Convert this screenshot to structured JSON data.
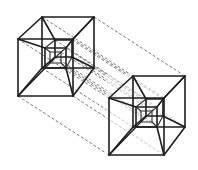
{
  "diagram": {
    "type": "line-drawing",
    "colors": {
      "ink": "#1e1e1e",
      "dash": "#555555",
      "background": "#ffffff"
    },
    "figures": [
      {
        "name": "left-tesseract",
        "outer_back": [
          [
            42,
            17
          ],
          [
            94,
            17
          ],
          [
            94,
            68
          ],
          [
            42,
            68
          ]
        ],
        "outer_front": [
          [
            18,
            39
          ],
          [
            73,
            39
          ],
          [
            73,
            96
          ],
          [
            18,
            96
          ]
        ],
        "inner_mid": [
          [
            45,
            48
          ],
          [
            66,
            48
          ],
          [
            66,
            68
          ],
          [
            45,
            68
          ]
        ],
        "inner_small": [
          [
            50,
            52
          ],
          [
            62,
            52
          ],
          [
            62,
            63
          ],
          [
            50,
            63
          ]
        ],
        "inner_back": [
          [
            55,
            40
          ],
          [
            72,
            40
          ],
          [
            72,
            57
          ],
          [
            55,
            57
          ]
        ]
      },
      {
        "name": "right-tesseract",
        "offset": [
          91,
          59
        ]
      }
    ],
    "connectors": "dashed parallel lines linking corresponding vertices of the two figures"
  }
}
